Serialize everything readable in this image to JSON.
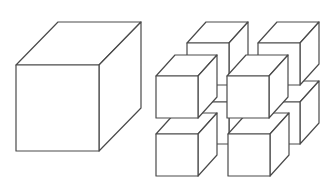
{
  "diagram": {
    "colors": {
      "background": "#ffffff",
      "stroke": "#4a4a4a",
      "fill": "#ffffff"
    },
    "large_cube": {
      "x": 16,
      "y": 65,
      "w": 83,
      "h": 86,
      "dx": 42,
      "dy": -43
    },
    "small_cube_size": {
      "w": 42,
      "h": 42,
      "dx": 19,
      "dy": -21
    },
    "small_cubes": [
      {
        "id": "back-bottom-left",
        "x": 187,
        "y": 102
      },
      {
        "id": "back-bottom-right",
        "x": 258,
        "y": 102
      },
      {
        "id": "back-top-left",
        "x": 187,
        "y": 43
      },
      {
        "id": "back-top-right",
        "x": 258,
        "y": 43
      },
      {
        "id": "front-bottom-left",
        "x": 156,
        "y": 134
      },
      {
        "id": "front-bottom-right",
        "x": 228,
        "y": 134
      },
      {
        "id": "front-top-left",
        "x": 156,
        "y": 76
      },
      {
        "id": "front-top-right",
        "x": 227,
        "y": 76
      }
    ]
  }
}
